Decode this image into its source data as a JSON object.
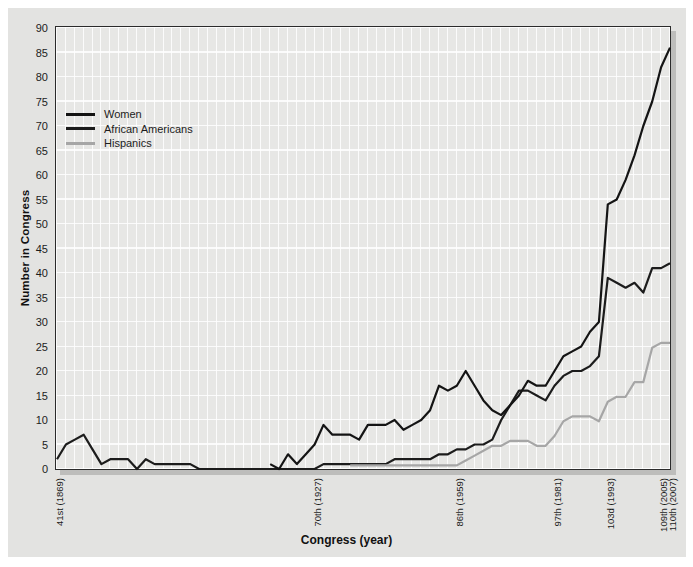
{
  "chart_data": {
    "type": "line",
    "title": "",
    "xlabel": "Congress (year)",
    "ylabel": "Number in Congress",
    "ylim": [
      0,
      90
    ],
    "yticks": [
      0,
      5,
      10,
      15,
      20,
      25,
      30,
      35,
      40,
      45,
      50,
      55,
      60,
      65,
      70,
      75,
      80,
      85,
      90
    ],
    "x_unit": "congress_number",
    "x_congress_range": [
      41,
      110
    ],
    "xticks": [
      {
        "congress": 41,
        "label": "41st (1869)"
      },
      {
        "congress": 70,
        "label": "70th (1927)"
      },
      {
        "congress": 86,
        "label": "86th (1959)"
      },
      {
        "congress": 97,
        "label": "97th (1981)"
      },
      {
        "congress": 103,
        "label": "103d (1993)"
      },
      {
        "congress": 109,
        "label": "109th (2005)"
      },
      {
        "congress": 110,
        "label": "110th (2007)"
      }
    ],
    "grid": true,
    "grid_color": "#ffffff",
    "plot_background": "#e7e7e5",
    "legend_position": "upper-left",
    "series": [
      {
        "name": "African Americans",
        "color": "#1c1c1c",
        "start_congress": 41,
        "values": [
          2,
          5,
          6,
          7,
          4,
          1,
          2,
          2,
          2,
          0,
          2,
          1,
          1,
          1,
          1,
          1,
          0,
          0,
          0,
          0,
          0,
          0,
          0,
          0,
          0,
          0,
          0,
          0,
          0,
          0,
          1,
          1,
          1,
          1,
          1,
          1,
          1,
          1,
          2,
          2,
          2,
          2,
          2,
          3,
          3,
          4,
          4,
          5,
          5,
          6,
          10,
          13,
          16,
          16,
          15,
          14,
          17,
          19,
          20,
          20,
          21,
          23,
          39,
          38,
          37,
          38,
          36,
          41,
          41,
          42
        ]
      },
      {
        "name": "Women",
        "color": "#141414",
        "start_congress": 65,
        "values": [
          1,
          0,
          3,
          1,
          3,
          5,
          9,
          7,
          7,
          7,
          6,
          9,
          9,
          9,
          10,
          8,
          9,
          10,
          12,
          17,
          16,
          17,
          20,
          17,
          14,
          12,
          11,
          13,
          15,
          18,
          17,
          17,
          20,
          23,
          24,
          25,
          28,
          30,
          54,
          55,
          59,
          64,
          70,
          75,
          82,
          86
        ]
      },
      {
        "name": "Hispanics",
        "color": "#a6a6a6",
        "start_congress": 74,
        "values": [
          1,
          1,
          1,
          1,
          1,
          1,
          1,
          1,
          1,
          1,
          1,
          1,
          1,
          2,
          3,
          4,
          5,
          5,
          6,
          6,
          6,
          5,
          5,
          7,
          10,
          11,
          11,
          11,
          10,
          14,
          15,
          15,
          18,
          18,
          25,
          26,
          26
        ]
      }
    ],
    "legend_order": [
      "Women",
      "African Americans",
      "Hispanics"
    ]
  }
}
